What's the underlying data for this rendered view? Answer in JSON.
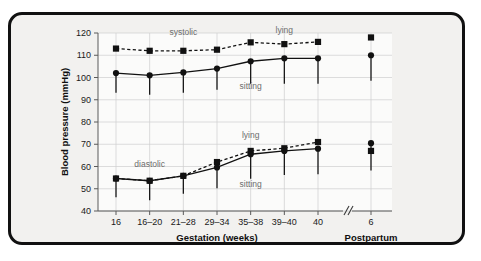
{
  "chart_data": {
    "type": "line",
    "title": "",
    "xlabel": "Gestation (weeks)",
    "xlabel_secondary": "Postpartum",
    "ylabel": "Blood pressure (mmHg)",
    "ylim": [
      40,
      120
    ],
    "ytick_labels": [
      "40",
      "50",
      "60",
      "70",
      "80",
      "90",
      "100",
      "110",
      "120"
    ],
    "ytick_values": [
      40,
      50,
      60,
      70,
      80,
      90,
      100,
      110,
      120
    ],
    "grid": true,
    "legend": "none",
    "axis_break": true,
    "categories": [
      "16",
      "16–20",
      "21–28",
      "29–34",
      "35–38",
      "39–40",
      "40"
    ],
    "postpartum_category": "6",
    "annotations": [
      {
        "text": "systolic",
        "x_category": "21–28",
        "y": 119
      },
      {
        "text": "lying",
        "x_category": "39–40",
        "y": 120
      },
      {
        "text": "sitting",
        "x_category": "35–38",
        "y": 95
      },
      {
        "text": "diastolic",
        "x_category": "16–20",
        "y": 60
      },
      {
        "text": "lying",
        "x_category": "35–38",
        "y": 73
      },
      {
        "text": "sitting",
        "x_category": "35–38",
        "y": 51
      }
    ],
    "series": [
      {
        "name": "systolic lying",
        "marker": "square",
        "linestyle": "dashed",
        "values": [
          113,
          112,
          112,
          112.5,
          115.8,
          115,
          116
        ],
        "postpartum_value": 118,
        "errors_low": [],
        "postpartum_error_low": null
      },
      {
        "name": "systolic sitting",
        "marker": "circle",
        "linestyle": "solid",
        "values": [
          102,
          101,
          102.3,
          104,
          107.3,
          108.6,
          108.6
        ],
        "postpartum_value": 110,
        "errors_low": [
          93.2,
          92.2,
          93.2,
          94.5,
          97.2,
          97.2,
          97.2
        ],
        "postpartum_error_low": 98.5
      },
      {
        "name": "diastolic lying",
        "marker": "square",
        "linestyle": "dashed",
        "values": [
          54.6,
          53.6,
          55.8,
          62,
          67,
          68.2,
          71
        ],
        "postpartum_value": 67,
        "errors_low": [],
        "postpartum_error_low": null
      },
      {
        "name": "diastolic sitting",
        "marker": "circle",
        "linestyle": "solid",
        "values": [
          54.6,
          53.6,
          55.8,
          59.6,
          65.5,
          67,
          68
        ],
        "postpartum_value": 70.5,
        "errors_low": [
          46.2,
          44.8,
          47.8,
          50.2,
          54.5,
          56.2,
          56.5
        ],
        "postpartum_error_low": 58.2
      }
    ]
  }
}
